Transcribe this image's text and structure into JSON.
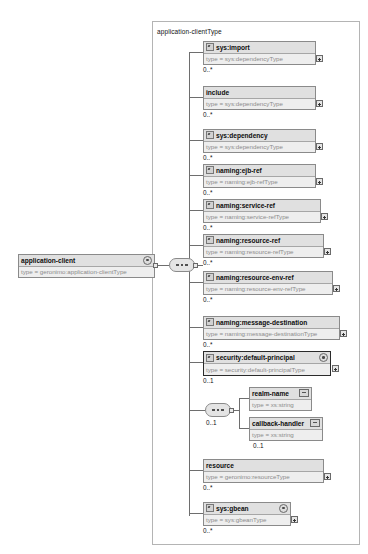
{
  "diagram": {
    "title": "application-clientType",
    "root": {
      "name": "application-client",
      "type": "type = geronimo:application-clientType",
      "marker": "abstract-circle-icon"
    },
    "compositor_root": {
      "kind": "sequence-compositor",
      "dots": "•••"
    },
    "children": [
      {
        "name": "sys:import",
        "type": "type = sys:dependencyType",
        "cardinality": "0..*",
        "attr_icon": "element-attribute-icon",
        "expander": "plus-icon",
        "marker": ""
      },
      {
        "name": "include",
        "type": "type = sys:dependencyType",
        "cardinality": "0..*",
        "attr_icon": "",
        "expander": "plus-icon",
        "marker": ""
      },
      {
        "name": "sys:dependency",
        "type": "type = sys:dependencyType",
        "cardinality": "0..*",
        "attr_icon": "element-attribute-icon",
        "expander": "plus-icon",
        "marker": ""
      },
      {
        "name": "naming:ejb-ref",
        "type": "type = naming:ejb-refType",
        "cardinality": "0..*",
        "attr_icon": "element-attribute-icon",
        "expander": "plus-icon",
        "marker": ""
      },
      {
        "name": "naming:service-ref",
        "type": "type = naming:service-refType",
        "cardinality": "0..*",
        "attr_icon": "element-attribute-icon",
        "expander": "plus-icon",
        "marker": ""
      },
      {
        "name": "naming:resource-ref",
        "type": "type = naming:resource-refType",
        "cardinality": "0..*",
        "attr_icon": "element-attribute-icon",
        "expander": "plus-icon",
        "marker": ""
      },
      {
        "name": "naming:resource-env-ref",
        "type": "type = naming:resource-env-refType",
        "cardinality": "0..*",
        "attr_icon": "element-attribute-icon",
        "expander": "plus-icon",
        "marker": ""
      },
      {
        "name": "naming:message-destination",
        "type": "type = naming:message-destinationType",
        "cardinality": "0..*",
        "attr_icon": "element-attribute-icon",
        "expander": "plus-icon",
        "marker": ""
      },
      {
        "name": "security:default-principal",
        "type": "type = security:default-principalType",
        "cardinality": "0..1",
        "attr_icon": "element-attribute-icon",
        "expander": "plus-icon",
        "marker": "abstract-circle-icon"
      },
      {
        "name": "resource",
        "type": "type = geronimo:resourceType",
        "cardinality": "0..*",
        "attr_icon": "",
        "expander": "plus-icon",
        "marker": ""
      },
      {
        "name": "sys:gbean",
        "type": "type = sys:gbeanType",
        "cardinality": "0..*",
        "attr_icon": "element-attribute-icon",
        "expander": "plus-icon",
        "marker": "abstract-circle-icon"
      }
    ],
    "inner_compositor": {
      "kind": "choice-compositor",
      "dots": "•••",
      "cardinality": "0..1"
    },
    "inner_children": [
      {
        "name": "realm-name",
        "type": "type = xs:string",
        "cardinality": "",
        "box_icon": "simple-type-icon"
      },
      {
        "name": "callback-handler",
        "type": "type = xs:string",
        "cardinality": "0..1",
        "box_icon": "simple-type-icon"
      }
    ]
  },
  "colors": {
    "node_border": "#8a8a8a",
    "node_title_bg": "#e0e0e0",
    "node_type_bg": "#eeeeee",
    "line": "#6e6e6e",
    "type_text": "#8c8c8c",
    "group_border": "#b4b4b4"
  }
}
